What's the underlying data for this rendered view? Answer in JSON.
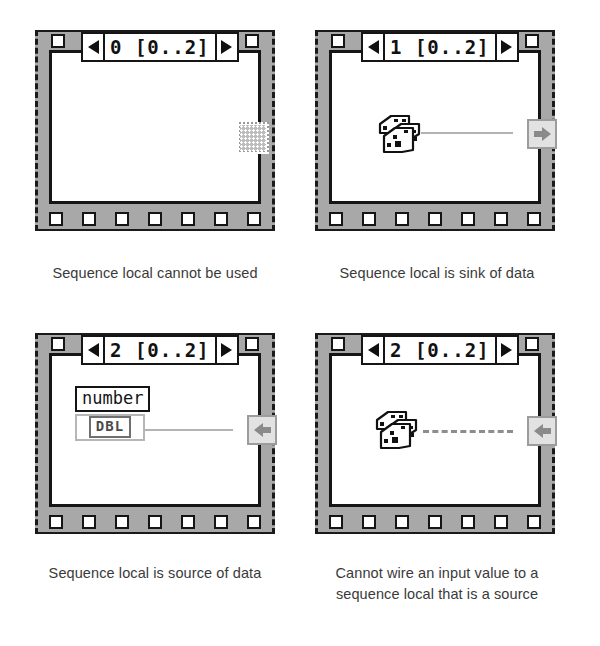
{
  "diagram": {
    "colors": {
      "frame_border": "#151515",
      "frame_fill": "#a8a8a8",
      "canvas": "#ffffff",
      "wire": "#b3b3b3",
      "terminal_fill": "#e2e2e2",
      "terminal_border": "#9c9c9c",
      "arrow_glyph": "#8a8a8a",
      "caption_text": "#3a3a3a"
    }
  },
  "panels": [
    {
      "id": "panel-frame-0",
      "frame_label": "0 [0..2]",
      "frame_index": "0",
      "frame_range": "[0..2]",
      "prev_arrow": "left-triangle",
      "next_arrow": "right-triangle",
      "sprocket_count_bottom": 7,
      "local": {
        "kind": "unused",
        "icon": "checkered-square-icon",
        "position": "right-edge"
      },
      "node": null,
      "wire": null,
      "caption": [
        "Sequence local cannot be used"
      ]
    },
    {
      "id": "panel-frame-1",
      "frame_label": "1 [0..2]",
      "frame_index": "1",
      "frame_range": "[0..2]",
      "prev_arrow": "left-triangle",
      "next_arrow": "right-triangle",
      "sprocket_count_bottom": 7,
      "local": {
        "kind": "sink",
        "icon": "arrow-right-icon",
        "position": "right-edge"
      },
      "node": {
        "kind": "random-number",
        "icon": "dice-icon"
      },
      "wire": {
        "state": "connected",
        "style": "solid"
      },
      "caption": [
        "Sequence local is sink of data"
      ]
    },
    {
      "id": "panel-frame-2-source",
      "frame_label": "2 [0..2]",
      "frame_index": "2",
      "frame_range": "[0..2]",
      "prev_arrow": "left-triangle",
      "next_arrow": "right-triangle",
      "sprocket_count_bottom": 7,
      "local": {
        "kind": "source",
        "icon": "arrow-left-icon",
        "position": "right-edge"
      },
      "node": {
        "kind": "numeric-indicator",
        "label": "number",
        "datatype": "DBL"
      },
      "wire": {
        "state": "connected",
        "style": "solid"
      },
      "caption": [
        "Sequence local is source of data"
      ]
    },
    {
      "id": "panel-frame-2-broken",
      "frame_label": "2 [0..2]",
      "frame_index": "2",
      "frame_range": "[0..2]",
      "prev_arrow": "left-triangle",
      "next_arrow": "right-triangle",
      "sprocket_count_bottom": 7,
      "local": {
        "kind": "source",
        "icon": "arrow-left-icon",
        "position": "right-edge"
      },
      "node": {
        "kind": "random-number",
        "icon": "dice-icon"
      },
      "wire": {
        "state": "broken",
        "style": "dashed"
      },
      "caption": [
        "Cannot wire an input value to a",
        "sequence local that is a source"
      ]
    }
  ]
}
